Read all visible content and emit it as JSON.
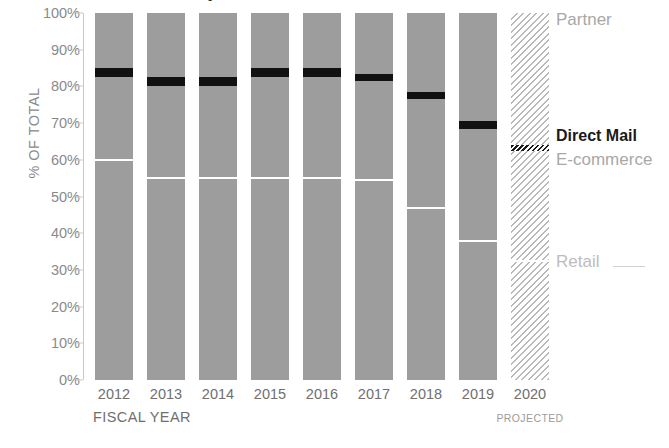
{
  "chart_data": {
    "type": "bar",
    "subtype": "100% stacked column",
    "title": "Revenue by channel",
    "xlabel": "FISCAL YEAR",
    "ylabel": "% OF TOTAL",
    "ylim": [
      0,
      100
    ],
    "ytick_labels": [
      "100%",
      "90%",
      "80%",
      "70%",
      "60%",
      "50%",
      "40%",
      "30%",
      "20%",
      "10%",
      "0%"
    ],
    "ytick_values": [
      100,
      90,
      80,
      70,
      60,
      50,
      40,
      30,
      20,
      10,
      0
    ],
    "grid": false,
    "legend_position": "right",
    "categories": [
      "2012",
      "2013",
      "2014",
      "2015",
      "2016",
      "2017",
      "2018",
      "2019",
      "2020"
    ],
    "projected_category": "2020",
    "projected_note": "PROJECTED",
    "series": [
      {
        "name": "Partner",
        "color": "#9d9d9d",
        "values": [
          15.0,
          17.5,
          17.5,
          15.0,
          15.0,
          16.5,
          21.5,
          29.5,
          36.0
        ]
      },
      {
        "name": "Direct Mail",
        "color": "#111111",
        "values": [
          2.5,
          2.5,
          2.5,
          2.5,
          2.5,
          2.0,
          2.0,
          2.0,
          1.5
        ]
      },
      {
        "name": "E-commerce",
        "color": "#9d9d9d",
        "values": [
          22.5,
          25.0,
          25.0,
          27.5,
          27.5,
          27.0,
          29.5,
          30.5,
          30.0
        ]
      },
      {
        "name": "Retail",
        "color": "#9d9d9d",
        "values": [
          60.0,
          55.0,
          55.0,
          55.0,
          55.0,
          54.5,
          47.0,
          38.0,
          32.5
        ]
      }
    ],
    "boundaries_top_of_direct_mail": [
      85.0,
      82.5,
      82.5,
      85.0,
      85.0,
      83.5,
      78.5,
      70.5,
      64.0
    ],
    "boundaries_bottom_of_direct_mail": [
      82.5,
      80.0,
      80.0,
      82.5,
      82.5,
      81.5,
      76.5,
      68.5,
      62.5
    ],
    "boundaries_ecommerce_retail": [
      60.0,
      55.0,
      55.0,
      55.0,
      55.0,
      54.5,
      47.0,
      38.0,
      32.5
    ]
  },
  "legend": {
    "partner": "Partner",
    "direct_mail": "Direct Mail",
    "ecommerce": "E-commerce",
    "retail": "Retail"
  },
  "colors": {
    "bar_gray": "#9d9d9d",
    "direct_mail_black": "#111111",
    "hatch_gray": "#b9b9b9",
    "axis_text": "#8a8a8a",
    "tick_text": "#6f6f6f"
  }
}
